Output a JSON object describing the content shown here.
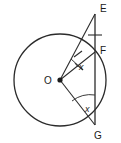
{
  "figure": {
    "type": "circle-geometry-diagram",
    "background_color": "#ffffff",
    "stroke_color": "#2b2b2b",
    "labels": {
      "center": "O",
      "point_e": "E",
      "point_f": "F",
      "point_g": "G",
      "angle_at_o": "x",
      "angle_at_g": "x"
    },
    "points": {
      "O": {
        "x": 60,
        "y": 80
      },
      "E": {
        "x": 95,
        "y": 12
      },
      "F": {
        "x": 95,
        "y": 52
      },
      "G": {
        "x": 95,
        "y": 125
      }
    },
    "circle": {
      "cx": 60,
      "cy": 80,
      "r": 46
    },
    "segments": [
      {
        "name": "OE",
        "from": "O",
        "to": "E"
      },
      {
        "name": "OF",
        "from": "O",
        "to": "F"
      },
      {
        "name": "OG",
        "from": "O",
        "to": "G"
      },
      {
        "name": "EG",
        "from": "E",
        "to": "G"
      }
    ],
    "marks": {
      "tick_on_EF": true,
      "tick_on_OE": true,
      "tick_on_OF": true,
      "arc_at_O": true,
      "arc_at_G": true
    }
  }
}
